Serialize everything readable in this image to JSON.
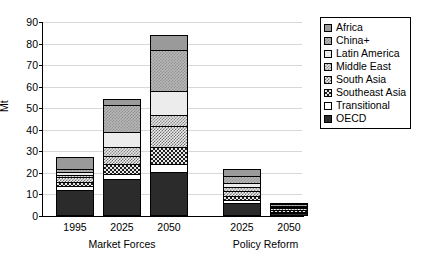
{
  "chart_data": {
    "type": "bar",
    "title": "",
    "subtitle": "",
    "xlabel": "",
    "ylabel": "Mt",
    "ylim": [
      0,
      90
    ],
    "ytick_values": [
      0,
      10,
      20,
      30,
      40,
      50,
      60,
      70,
      80,
      90
    ],
    "ytick_labels": [
      "0",
      "10",
      "20",
      "30",
      "40",
      "50",
      "60",
      "70",
      "80",
      "90"
    ],
    "grid": true,
    "stacked": true,
    "legend_position": "top-right",
    "group_labels": [
      "Market Forces",
      "Policy Reform"
    ],
    "categories": [
      "1995",
      "2025",
      "2050",
      "2025",
      "2050"
    ],
    "category_groups": [
      "Market Forces",
      "Market Forces",
      "Market Forces",
      "Policy Reform",
      "Policy Reform"
    ],
    "series": [
      {
        "name": "OECD",
        "pattern": "solid-black",
        "values": [
          12.0,
          17.0,
          20.5,
          6.0,
          1.5
        ]
      },
      {
        "name": "Transitional",
        "pattern": "solid-white",
        "values": [
          2.0,
          2.5,
          3.5,
          1.5,
          0.5
        ]
      },
      {
        "name": "Southeast Asia",
        "pattern": "dense-checker-dark",
        "values": [
          2.0,
          4.5,
          8.0,
          2.0,
          0.8
        ]
      },
      {
        "name": "South Asia",
        "pattern": "fine-checker-mid",
        "values": [
          2.0,
          4.0,
          10.0,
          2.0,
          0.8
        ]
      },
      {
        "name": "Middle East",
        "pattern": "fine-checker-grey",
        "values": [
          1.0,
          4.0,
          5.0,
          2.0,
          0.6
        ]
      },
      {
        "name": "Latin America",
        "pattern": "solid-light",
        "values": [
          1.5,
          7.0,
          11.0,
          2.0,
          0.6
        ]
      },
      {
        "name": "China+",
        "pattern": "checker-mid-grey",
        "values": [
          1.5,
          12.5,
          19.0,
          3.0,
          0.9
        ]
      },
      {
        "name": "Africa",
        "pattern": "solid-mid-grey",
        "values": [
          5.5,
          3.0,
          7.0,
          3.5,
          0.3
        ]
      }
    ],
    "totals": [
      27.5,
      54.5,
      84.0,
      22.0,
      6.0
    ]
  },
  "legend": {
    "items": [
      {
        "label": "Africa"
      },
      {
        "label": "China+"
      },
      {
        "label": "Latin America"
      },
      {
        "label": "Middle East"
      },
      {
        "label": "South Asia"
      },
      {
        "label": "Southeast Asia"
      },
      {
        "label": "Transitional"
      },
      {
        "label": "OECD"
      }
    ]
  }
}
